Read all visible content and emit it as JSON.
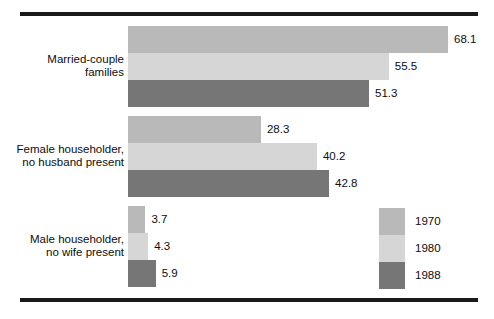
{
  "chart_data": {
    "type": "bar",
    "orientation": "horizontal",
    "title": "",
    "subtitle": "",
    "xlabel": "",
    "ylabel": "",
    "grid": false,
    "legend_position": "bottom-right",
    "xlim": [
      0,
      68.1
    ],
    "categories": [
      "Married-couple\nfamilies",
      "Female householder,\nno husband present",
      "Male householder,\nno wife present"
    ],
    "series": [
      {
        "name": "1970",
        "color": "#b9b9b9",
        "values": [
          68.1,
          28.3,
          3.7
        ]
      },
      {
        "name": "1980",
        "color": "#d6d6d6",
        "values": [
          55.5,
          40.2,
          4.3
        ]
      },
      {
        "name": "1988",
        "color": "#767676",
        "values": [
          51.3,
          42.8,
          5.9
        ]
      }
    ],
    "data_labels": [
      [
        "68.1",
        "55.5",
        "51.3"
      ],
      [
        "28.3",
        "40.2",
        "42.8"
      ],
      [
        "3.7",
        "4.3",
        "5.9"
      ]
    ]
  },
  "legend": {
    "items": [
      {
        "label": "1970",
        "color": "#b9b9b9"
      },
      {
        "label": "1980",
        "color": "#d6d6d6"
      },
      {
        "label": "1988",
        "color": "#767676"
      }
    ]
  },
  "rules": {
    "top_color": "#1a1a1a",
    "bottom_color": "#1a1a1a"
  }
}
